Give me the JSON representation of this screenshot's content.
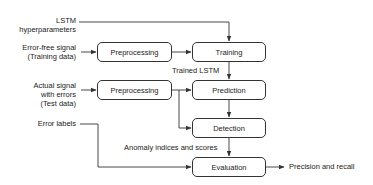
{
  "diagram": {
    "inputs": {
      "lstm_hyperparameters": [
        "LSTM",
        "hyperparameters"
      ],
      "error_free_signal": [
        "Error-free signal",
        "(Training data)"
      ],
      "actual_signal": [
        "Actual signal",
        "with errors",
        "(Test  data)"
      ],
      "error_labels": "Error labels"
    },
    "boxes": {
      "preprocessing_train": "Preprocessing",
      "training": "Training",
      "preprocessing_test": "Preprocessing",
      "prediction": "Prediction",
      "detection": "Detection",
      "evaluation": "Evaluation"
    },
    "edge_labels": {
      "trained_lstm": "Trained LSTM",
      "anomaly_indices": "Anomaly indices and scores"
    },
    "output": "Precision and recall",
    "line_color": "#333333"
  }
}
